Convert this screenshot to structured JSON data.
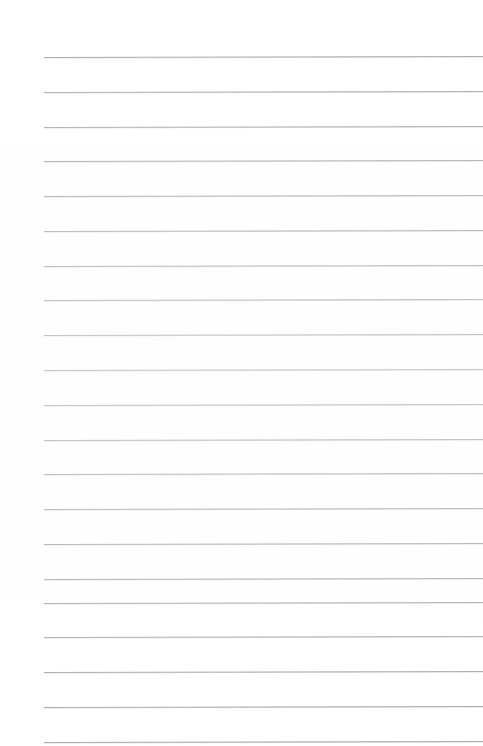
{
  "document": {
    "kind": "ruled-notepad-page",
    "title": "Ruled Notepad Page",
    "page_width": 483,
    "page_height": 746,
    "background_color": "#ffffff",
    "body_text": "",
    "heading_text": "",
    "has_visible_text": "false"
  },
  "ruling": {
    "line_color": "#a9acb0",
    "line_thickness_px": 1,
    "line_count": 20,
    "first_line_y": 57,
    "line_spacing_px": 34.8,
    "line_start_x": 44,
    "line_end_x": 483,
    "tilt_degrees": -0.12,
    "lines": [
      {
        "index": 1,
        "y": 57,
        "x_start": 44,
        "x_end": 483
      },
      {
        "index": 2,
        "y": 92,
        "x_start": 44,
        "x_end": 483
      },
      {
        "index": 3,
        "y": 127,
        "x_start": 44,
        "x_end": 483
      },
      {
        "index": 4,
        "y": 161,
        "x_start": 44,
        "x_end": 483
      },
      {
        "index": 5,
        "y": 196,
        "x_start": 44,
        "x_end": 483
      },
      {
        "index": 6,
        "y": 231,
        "x_start": 44,
        "x_end": 483
      },
      {
        "index": 7,
        "y": 266,
        "x_start": 44,
        "x_end": 483
      },
      {
        "index": 8,
        "y": 300,
        "x_start": 44,
        "x_end": 483
      },
      {
        "index": 9,
        "y": 335,
        "x_start": 44,
        "x_end": 483
      },
      {
        "index": 10,
        "y": 370,
        "x_start": 44,
        "x_end": 483
      },
      {
        "index": 11,
        "y": 405,
        "x_start": 44,
        "x_end": 483
      },
      {
        "index": 12,
        "y": 440,
        "x_start": 44,
        "x_end": 483
      },
      {
        "index": 13,
        "y": 474,
        "x_start": 44,
        "x_end": 483
      },
      {
        "index": 14,
        "y": 509,
        "x_start": 44,
        "x_end": 483
      },
      {
        "index": 15,
        "y": 544,
        "x_start": 44,
        "x_end": 483
      },
      {
        "index": 16,
        "y": 579,
        "x_start": 44,
        "x_end": 483
      },
      {
        "index": 17,
        "y": 603,
        "x_start": 44,
        "x_end": 483
      },
      {
        "index": 18,
        "y": 637,
        "x_start": 44,
        "x_end": 483
      },
      {
        "index": 19,
        "y": 672,
        "x_start": 44,
        "x_end": 483
      },
      {
        "index": 20,
        "y": 707,
        "x_start": 44,
        "x_end": 483
      },
      {
        "index": 21,
        "y": 742,
        "x_start": 44,
        "x_end": 483
      }
    ]
  },
  "margins": {
    "left_margin_px": 44,
    "top_margin_px": 57,
    "right_margin_px": 0,
    "bottom_margin_px": 4
  }
}
